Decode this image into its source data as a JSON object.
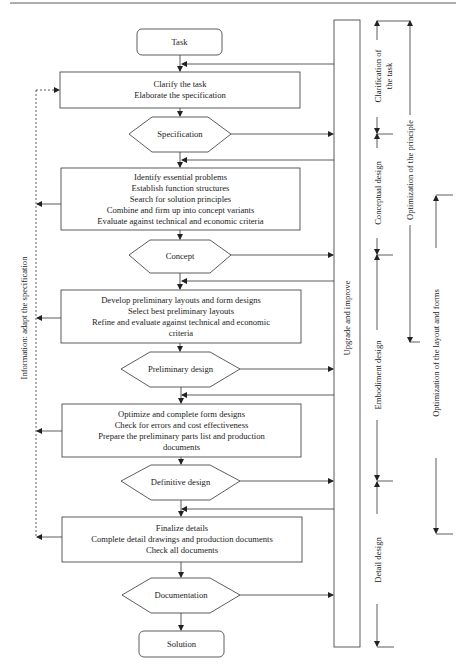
{
  "flow": {
    "task": "Task",
    "clarify": [
      "Clarify the task",
      "Elaborate the specification"
    ],
    "specification": "Specification",
    "conceptual_steps": [
      "Identify essential problems",
      "Establish function structures",
      "Search for solution principles",
      "Combine and firm up into concept variants",
      "Evaluate against technical and economic criteria"
    ],
    "concept": "Concept",
    "embodiment_steps": [
      "Develop preliminary layouts and form designs",
      "Select best preliminary layouts",
      "Refine and evaluate against technical and economic",
      "criteria"
    ],
    "preliminary_design": "Preliminary design",
    "optimize_steps": [
      "Optimize and complete form designs",
      "Check for errors and cost effectiveness",
      "Prepare the preliminary parts list and production",
      "documents"
    ],
    "definitive_design": "Definitive design",
    "detail_steps": [
      "Finalize details",
      "Complete detail drawings and production documents",
      "Check all documents"
    ],
    "documentation": "Documentation",
    "solution": "Solution"
  },
  "side": {
    "upgrade": "Upgrade and improve",
    "information": "Information: adapt the specification"
  },
  "phases": {
    "clarification": [
      "Clarification of",
      "the task"
    ],
    "conceptual": "Conceptual design",
    "embodiment": "Embodiment design",
    "detail": "Detail design"
  },
  "optimization": {
    "principle": "Optimization of the principle",
    "layout": "Optimization of the layout and forms"
  },
  "colors": {
    "line": "#333333",
    "background": "#ffffff"
  }
}
